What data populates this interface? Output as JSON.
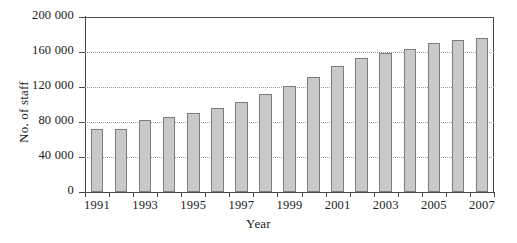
{
  "chart_data": {
    "type": "bar",
    "title": "",
    "xlabel": "Year",
    "ylabel": "No. of staff",
    "categories": [
      "1991",
      "1992",
      "1993",
      "1994",
      "1995",
      "1996",
      "1997",
      "1998",
      "1999",
      "2000",
      "2001",
      "2002",
      "2003",
      "2004",
      "2005",
      "2006",
      "2007"
    ],
    "values": [
      72000,
      72000,
      82000,
      86000,
      90000,
      96000,
      103000,
      112000,
      121000,
      132000,
      144000,
      153000,
      159000,
      163000,
      170000,
      174000,
      176000
    ],
    "ylim": [
      0,
      200000
    ],
    "yticks": [
      0,
      40000,
      80000,
      120000,
      160000,
      200000
    ],
    "ytick_labels": [
      "0",
      "40 000",
      "80 000",
      "120 000",
      "160 000",
      "200 000"
    ],
    "xtick_labels": [
      "1991",
      "1993",
      "1995",
      "1997",
      "1999",
      "2001",
      "2003",
      "2005",
      "2007"
    ],
    "grid": true,
    "legend": "none",
    "bar_color": "#c9c9c9",
    "bar_border_color": "#7d7d7d",
    "axis_color": "#4a4a4a",
    "grid_color": "#9a9a9a"
  }
}
